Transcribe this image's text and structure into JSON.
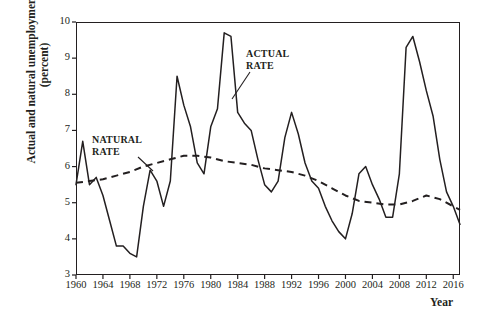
{
  "chart_data": {
    "type": "line",
    "title": "",
    "xlabel": "Year",
    "ylabel": "Actual and natural unemployment rates (percent)",
    "xlim": [
      1960,
      2017
    ],
    "ylim": [
      3,
      10
    ],
    "xticks": [
      1960,
      1964,
      1968,
      1972,
      1976,
      1980,
      1984,
      1988,
      1992,
      1996,
      2000,
      2004,
      2008,
      2012,
      2016
    ],
    "yticks": [
      3,
      4,
      5,
      6,
      7,
      8,
      9,
      10
    ],
    "grid": false,
    "legend_position": "inline-annotations",
    "annotations": [
      {
        "name": "actual-rate-label",
        "text_lines": [
          "ACTUAL",
          "RATE"
        ],
        "points_to_year": 1983
      },
      {
        "name": "natural-rate-label",
        "text_lines": [
          "NATURAL",
          "RATE"
        ],
        "points_to_year": 1971
      }
    ],
    "series": [
      {
        "name": "ACTUAL RATE",
        "style": "solid",
        "color": "#231f20",
        "x": [
          1960,
          1961,
          1962,
          1963,
          1964,
          1965,
          1966,
          1967,
          1968,
          1969,
          1970,
          1971,
          1972,
          1973,
          1974,
          1975,
          1976,
          1977,
          1978,
          1979,
          1980,
          1981,
          1982,
          1983,
          1984,
          1985,
          1986,
          1987,
          1988,
          1989,
          1990,
          1991,
          1992,
          1993,
          1994,
          1995,
          1996,
          1997,
          1998,
          1999,
          2000,
          2001,
          2002,
          2003,
          2004,
          2005,
          2006,
          2007,
          2008,
          2009,
          2010,
          2011,
          2012,
          2013,
          2014,
          2015,
          2016,
          2017
        ],
        "values": [
          5.5,
          6.7,
          5.5,
          5.7,
          5.2,
          4.5,
          3.8,
          3.8,
          3.6,
          3.5,
          4.9,
          5.9,
          5.6,
          4.9,
          5.6,
          8.5,
          7.7,
          7.1,
          6.1,
          5.8,
          7.1,
          7.6,
          9.7,
          9.6,
          7.5,
          7.2,
          7.0,
          6.2,
          5.5,
          5.3,
          5.6,
          6.8,
          7.5,
          6.9,
          6.1,
          5.6,
          5.4,
          4.9,
          4.5,
          4.2,
          4.0,
          4.7,
          5.8,
          6.0,
          5.5,
          5.1,
          4.6,
          4.6,
          5.8,
          9.3,
          9.6,
          8.9,
          8.1,
          7.4,
          6.2,
          5.3,
          4.9,
          4.4
        ]
      },
      {
        "name": "NATURAL RATE",
        "style": "dashed",
        "color": "#231f20",
        "x": [
          1960,
          1962,
          1964,
          1966,
          1968,
          1970,
          1972,
          1974,
          1976,
          1978,
          1980,
          1982,
          1984,
          1986,
          1988,
          1990,
          1992,
          1994,
          1996,
          1998,
          2000,
          2002,
          2004,
          2006,
          2008,
          2010,
          2012,
          2014,
          2016,
          2017
        ],
        "values": [
          5.55,
          5.6,
          5.65,
          5.75,
          5.85,
          6.0,
          6.1,
          6.2,
          6.3,
          6.3,
          6.25,
          6.15,
          6.1,
          6.05,
          5.95,
          5.9,
          5.85,
          5.75,
          5.6,
          5.4,
          5.2,
          5.05,
          5.0,
          4.95,
          4.95,
          5.05,
          5.2,
          5.1,
          4.9,
          4.8
        ]
      }
    ]
  },
  "axes": {
    "y_title": "Actual and natural unemployment rates (percent)",
    "x_title": "Year",
    "x_tick_labels": [
      "1960",
      "1964",
      "1968",
      "1972",
      "1976",
      "1980",
      "1984",
      "1988",
      "1992",
      "1996",
      "2000",
      "2004",
      "2008",
      "2012",
      "2016"
    ],
    "y_tick_labels": [
      "3",
      "4",
      "5",
      "6",
      "7",
      "8",
      "9",
      "10"
    ]
  },
  "labels": {
    "actual_line1": "ACTUAL",
    "actual_line2": "RATE",
    "natural_line1": "NATURAL",
    "natural_line2": "RATE"
  },
  "colors": {
    "ink": "#231f20",
    "background": "#ffffff"
  }
}
